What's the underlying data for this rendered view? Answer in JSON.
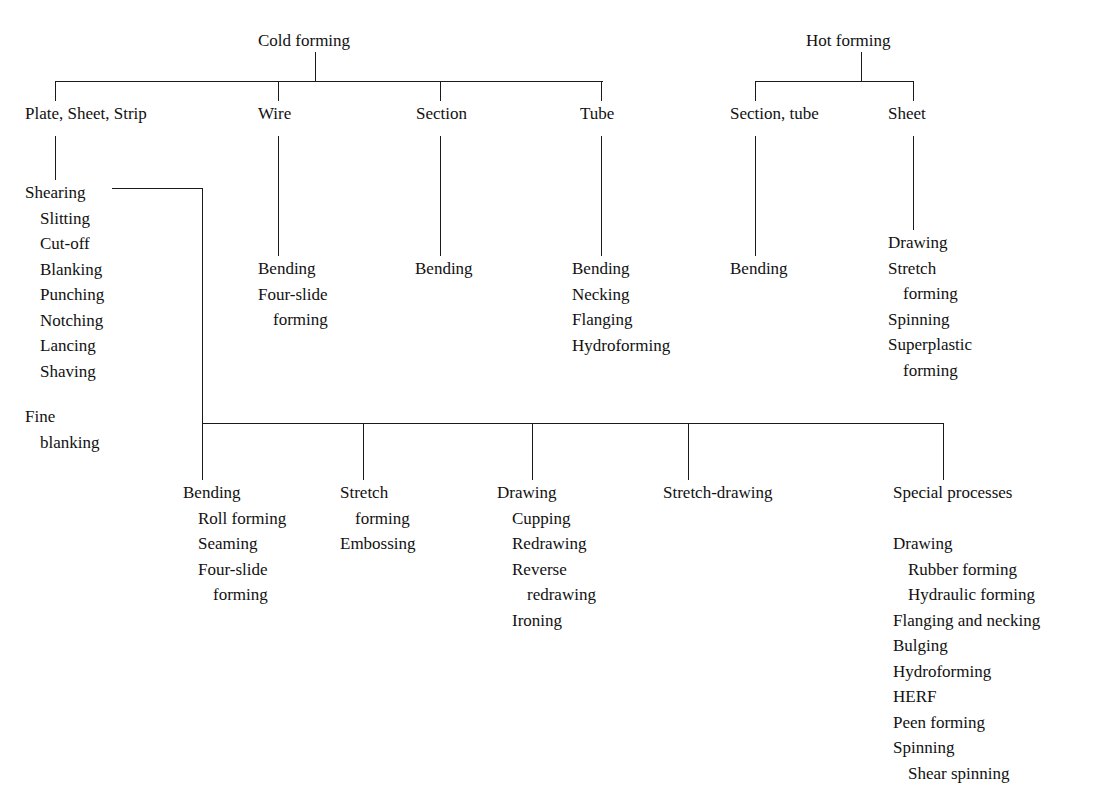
{
  "diagram": {
    "line_color": "#1a1a1a",
    "background": "#ffffff",
    "roots": [
      {
        "id": "cold-forming",
        "label": "Cold forming"
      },
      {
        "id": "hot-forming",
        "label": "Hot forming"
      }
    ],
    "level1": [
      {
        "id": "plate-sheet-strip",
        "label": "Plate, Sheet, Strip",
        "parent": "cold-forming"
      },
      {
        "id": "wire",
        "label": "Wire",
        "parent": "cold-forming"
      },
      {
        "id": "section",
        "label": "Section",
        "parent": "cold-forming"
      },
      {
        "id": "tube",
        "label": "Tube",
        "parent": "cold-forming"
      },
      {
        "id": "section-tube",
        "label": "Section, tube",
        "parent": "hot-forming"
      },
      {
        "id": "sheet-hot",
        "label": "Sheet",
        "parent": "hot-forming"
      }
    ],
    "lists": {
      "plate_sheet_strip": [
        {
          "text": "Shearing",
          "indent": 0
        },
        {
          "text": "Slitting",
          "indent": 1
        },
        {
          "text": "Cut-off",
          "indent": 1
        },
        {
          "text": "Blanking",
          "indent": 1
        },
        {
          "text": "Punching",
          "indent": 1
        },
        {
          "text": "Notching",
          "indent": 1
        },
        {
          "text": "Lancing",
          "indent": 1
        },
        {
          "text": "Shaving",
          "indent": 1
        }
      ],
      "fine_blanking": [
        {
          "text": "Fine",
          "indent": 0
        },
        {
          "text": "blanking",
          "indent": 1
        }
      ],
      "wire": [
        {
          "text": "Bending",
          "indent": 0
        },
        {
          "text": "Four-slide",
          "indent": 0
        },
        {
          "text": "forming",
          "indent": 1
        }
      ],
      "section": [
        {
          "text": "Bending",
          "indent": 0
        }
      ],
      "tube": [
        {
          "text": "Bending",
          "indent": 0
        },
        {
          "text": "Necking",
          "indent": 0
        },
        {
          "text": "Flanging",
          "indent": 0
        },
        {
          "text": "Hydroforming",
          "indent": 0
        }
      ],
      "section_tube_hot": [
        {
          "text": "Bending",
          "indent": 0
        }
      ],
      "sheet_hot": [
        {
          "text": "Drawing",
          "indent": 0
        },
        {
          "text": "Stretch",
          "indent": 0
        },
        {
          "text": "forming",
          "indent": 1
        },
        {
          "text": "Spinning",
          "indent": 0
        },
        {
          "text": "Superplastic",
          "indent": 0
        },
        {
          "text": "forming",
          "indent": 1
        }
      ],
      "bending_lower": [
        {
          "text": "Bending",
          "indent": 0
        },
        {
          "text": "Roll forming",
          "indent": 1
        },
        {
          "text": "Seaming",
          "indent": 1
        },
        {
          "text": "Four-slide",
          "indent": 1
        },
        {
          "text": "forming",
          "indent": 2
        }
      ],
      "stretch_lower": [
        {
          "text": "Stretch",
          "indent": 0
        },
        {
          "text": "forming",
          "indent": 1
        },
        {
          "text": "Embossing",
          "indent": 0
        }
      ],
      "drawing_lower": [
        {
          "text": "Drawing",
          "indent": 0
        },
        {
          "text": "Cupping",
          "indent": 1
        },
        {
          "text": "Redrawing",
          "indent": 1
        },
        {
          "text": "Reverse",
          "indent": 1
        },
        {
          "text": "redrawing",
          "indent": 2
        },
        {
          "text": "Ironing",
          "indent": 1
        }
      ],
      "stretch_drawing_lower": [
        {
          "text": "Stretch-drawing",
          "indent": 0
        }
      ],
      "special_processes_header": [
        {
          "text": "Special processes",
          "indent": 0
        }
      ],
      "special_processes": [
        {
          "text": "Drawing",
          "indent": 0
        },
        {
          "text": "Rubber forming",
          "indent": 1
        },
        {
          "text": "Hydraulic forming",
          "indent": 1
        },
        {
          "text": "Flanging and necking",
          "indent": 0
        },
        {
          "text": "Bulging",
          "indent": 0
        },
        {
          "text": "Hydroforming",
          "indent": 0
        },
        {
          "text": "HERF",
          "indent": 0
        },
        {
          "text": "Peen forming",
          "indent": 0
        },
        {
          "text": "Spinning",
          "indent": 0
        },
        {
          "text": "Shear spinning",
          "indent": 1
        }
      ]
    }
  }
}
